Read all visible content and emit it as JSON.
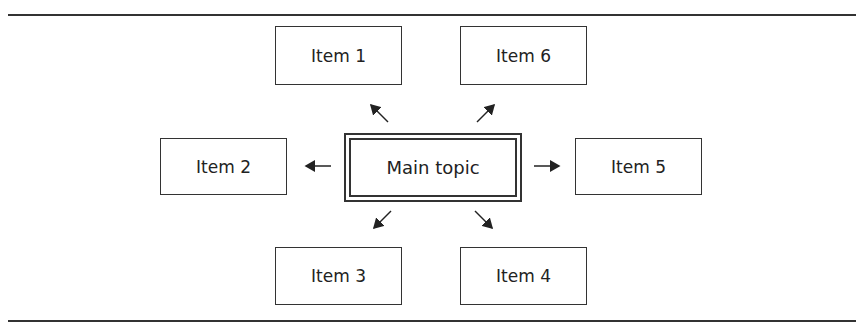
{
  "diagram": {
    "type": "mind-map",
    "center": {
      "label": "Main topic"
    },
    "items": [
      {
        "id": 1,
        "label": "Item 1",
        "position": "top-left"
      },
      {
        "id": 2,
        "label": "Item 2",
        "position": "left"
      },
      {
        "id": 3,
        "label": "Item 3",
        "position": "bottom-left"
      },
      {
        "id": 4,
        "label": "Item 4",
        "position": "bottom-right"
      },
      {
        "id": 5,
        "label": "Item 5",
        "position": "right"
      },
      {
        "id": 6,
        "label": "Item 6",
        "position": "top-right"
      }
    ]
  }
}
